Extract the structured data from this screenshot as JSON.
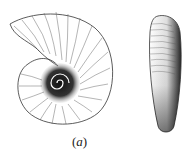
{
  "figure": {
    "caption_open": "(",
    "caption_letter": "a",
    "caption_close": ")",
    "subjects": [
      "ammonite-shell-lateral-view",
      "ammonite-shell-ventral-view"
    ]
  }
}
